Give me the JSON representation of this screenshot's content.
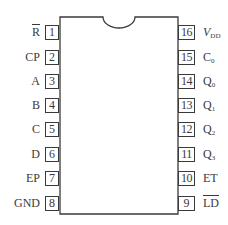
{
  "diagram": {
    "type": "ic-pinout",
    "package": "DIP-16",
    "stroke_color": "#3a3a3a",
    "background": "#ffffff",
    "left_pins": [
      {
        "number": "1",
        "label": "R",
        "overline": true
      },
      {
        "number": "2",
        "label": "CP",
        "overline": false
      },
      {
        "number": "3",
        "label": "A",
        "overline": false
      },
      {
        "number": "4",
        "label": "B",
        "overline": false
      },
      {
        "number": "5",
        "label": "C",
        "overline": false
      },
      {
        "number": "6",
        "label": "D",
        "overline": false
      },
      {
        "number": "7",
        "label": "EP",
        "overline": false
      },
      {
        "number": "8",
        "label": "GND",
        "overline": false
      }
    ],
    "right_pins": [
      {
        "number": "16",
        "label": "V",
        "subscript": "DD",
        "italic": true
      },
      {
        "number": "15",
        "label": "C",
        "subscript": "0"
      },
      {
        "number": "14",
        "label": "Q",
        "subscript": "0"
      },
      {
        "number": "13",
        "label": "Q",
        "subscript": "1"
      },
      {
        "number": "12",
        "label": "Q",
        "subscript": "2"
      },
      {
        "number": "11",
        "label": "Q",
        "subscript": "3"
      },
      {
        "number": "10",
        "label": "ET"
      },
      {
        "number": "9",
        "label": "LD",
        "overline": true
      }
    ]
  }
}
